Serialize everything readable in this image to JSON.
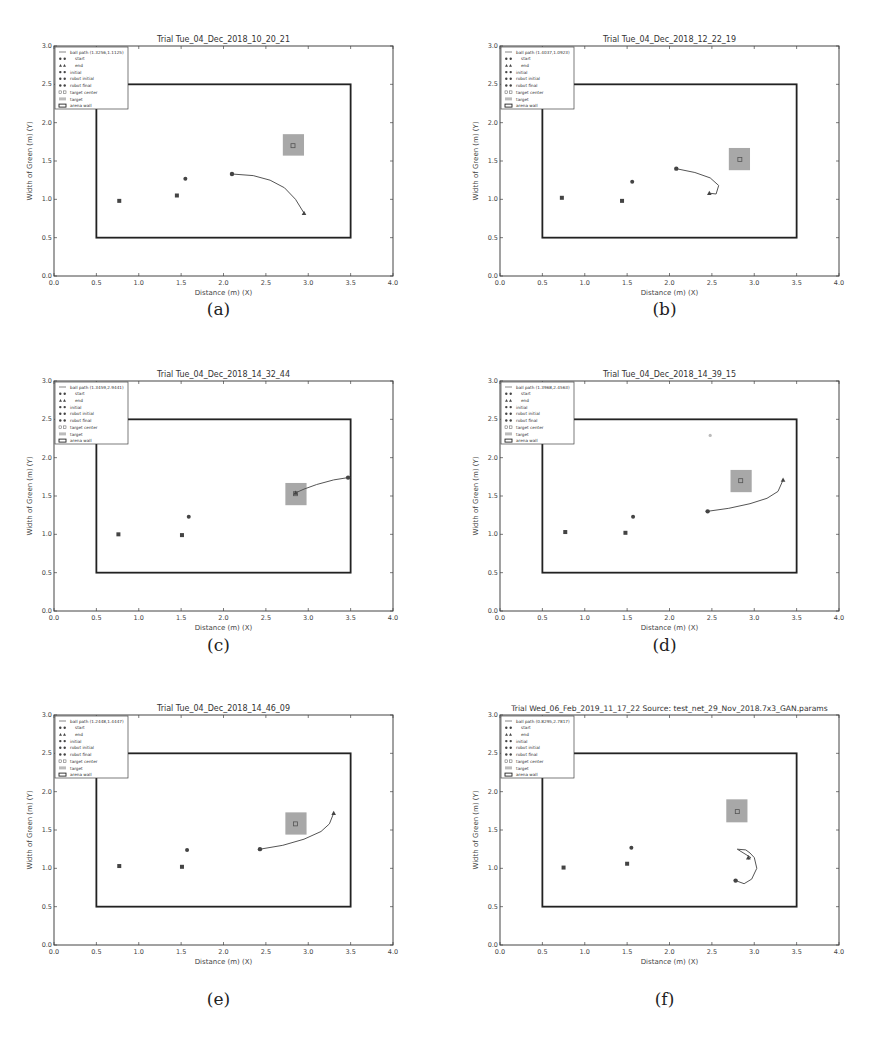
{
  "figure": {
    "panels_count": 6
  },
  "chart_data": [
    {
      "type": "scatter",
      "panel_label": "(a)",
      "title": "Trial Tue_04_Dec_2018_10_20_21",
      "xlabel": "Distance (m) (X)",
      "ylabel": "Width of Green (m) (Y)",
      "xlim": [
        0.0,
        4.0
      ],
      "ylim": [
        0.0,
        3.0
      ],
      "xticks": [
        "0.0",
        "0.5",
        "1.0",
        "1.5",
        "2.0",
        "2.5",
        "3.0",
        "3.5",
        "4.0"
      ],
      "yticks": [
        "0.0",
        "0.5",
        "1.0",
        "1.5",
        "2.0",
        "2.5",
        "3.0"
      ],
      "legend": [
        "ball path (1.3256,1.1125)",
        "start",
        "end",
        "initial",
        "robot initial",
        "robot final",
        "target center",
        "target",
        "arena wall"
      ],
      "arena_wall": {
        "x": [
          0.5,
          3.5
        ],
        "y": [
          0.5,
          2.5
        ]
      },
      "target": {
        "x": [
          2.7,
          2.95
        ],
        "y": [
          1.57,
          1.85
        ]
      },
      "target_center": [
        2.82,
        1.7
      ],
      "robot_initial": [
        0.77,
        0.98
      ],
      "robot_final": [
        1.45,
        1.05
      ],
      "initial": [
        1.55,
        1.27
      ],
      "start": [
        2.1,
        1.33
      ],
      "end": [
        2.95,
        0.82
      ],
      "ball_path": [
        [
          2.1,
          1.33
        ],
        [
          2.35,
          1.31
        ],
        [
          2.55,
          1.25
        ],
        [
          2.72,
          1.15
        ],
        [
          2.85,
          1.0
        ],
        [
          2.95,
          0.82
        ]
      ]
    },
    {
      "type": "scatter",
      "panel_label": "(b)",
      "title": "Trial Tue_04_Dec_2018_12_22_19",
      "xlabel": "Distance (m) (X)",
      "ylabel": "Width of Green (m) (Y)",
      "xlim": [
        0.0,
        4.0
      ],
      "ylim": [
        0.0,
        3.0
      ],
      "xticks": [
        "0.0",
        "0.5",
        "1.0",
        "1.5",
        "2.0",
        "2.5",
        "3.0",
        "3.5",
        "4.0"
      ],
      "yticks": [
        "0.0",
        "0.5",
        "1.0",
        "1.5",
        "2.0",
        "2.5",
        "3.0"
      ],
      "legend": [
        "ball path (1.4037,1.0923)",
        "start",
        "end",
        "initial",
        "robot initial",
        "robot final",
        "target center",
        "target",
        "arena wall"
      ],
      "arena_wall": {
        "x": [
          0.5,
          3.5
        ],
        "y": [
          0.5,
          2.5
        ]
      },
      "target": {
        "x": [
          2.7,
          2.95
        ],
        "y": [
          1.38,
          1.67
        ]
      },
      "target_center": [
        2.83,
        1.52
      ],
      "robot_initial": [
        0.73,
        1.02
      ],
      "robot_final": [
        1.44,
        0.98
      ],
      "initial": [
        1.56,
        1.23
      ],
      "start": [
        2.08,
        1.4
      ],
      "end": [
        2.47,
        1.08
      ],
      "ball_path": [
        [
          2.08,
          1.4
        ],
        [
          2.3,
          1.35
        ],
        [
          2.48,
          1.28
        ],
        [
          2.58,
          1.18
        ],
        [
          2.55,
          1.07
        ],
        [
          2.47,
          1.08
        ]
      ]
    },
    {
      "type": "scatter",
      "panel_label": "(c)",
      "title": "Trial Tue_04_Dec_2018_14_32_44",
      "xlabel": "Distance (m) (X)",
      "ylabel": "Width of Green (m) (Y)",
      "xlim": [
        0.0,
        4.0
      ],
      "ylim": [
        0.0,
        3.0
      ],
      "xticks": [
        "0.0",
        "0.5",
        "1.0",
        "1.5",
        "2.0",
        "2.5",
        "3.0",
        "3.5",
        "4.0"
      ],
      "yticks": [
        "0.0",
        "0.5",
        "1.0",
        "1.5",
        "2.0",
        "2.5",
        "3.0"
      ],
      "legend": [
        "ball path (1.3459,2.9441)",
        "start",
        "end",
        "initial",
        "robot initial",
        "robot final",
        "target center",
        "target",
        "arena wall"
      ],
      "arena_wall": {
        "x": [
          0.5,
          3.5
        ],
        "y": [
          0.5,
          2.5
        ]
      },
      "target": {
        "x": [
          2.73,
          2.98
        ],
        "y": [
          1.38,
          1.67
        ]
      },
      "target_center": [
        2.85,
        1.53
      ],
      "robot_initial": [
        0.76,
        1.0
      ],
      "robot_final": [
        1.51,
        0.99
      ],
      "initial": [
        1.59,
        1.23
      ],
      "start": [
        3.47,
        1.74
      ],
      "end": [
        2.85,
        1.54
      ],
      "ball_path": [
        [
          3.47,
          1.74
        ],
        [
          3.3,
          1.71
        ],
        [
          3.1,
          1.65
        ],
        [
          2.95,
          1.59
        ],
        [
          2.85,
          1.54
        ]
      ]
    },
    {
      "type": "scatter",
      "panel_label": "(d)",
      "title": "Trial Tue_04_Dec_2018_14_39_15",
      "xlabel": "Distance (m) (X)",
      "ylabel": "Width of Green (m) (Y)",
      "xlim": [
        0.0,
        4.0
      ],
      "ylim": [
        0.0,
        3.0
      ],
      "xticks": [
        "0.0",
        "0.5",
        "1.0",
        "1.5",
        "2.0",
        "2.5",
        "3.0",
        "3.5",
        "4.0"
      ],
      "yticks": [
        "0.0",
        "0.5",
        "1.0",
        "1.5",
        "2.0",
        "2.5",
        "3.0"
      ],
      "legend": [
        "ball path (1.3968,2.4563)",
        "start",
        "end",
        "initial",
        "robot initial",
        "robot final",
        "target center",
        "target",
        "arena wall"
      ],
      "arena_wall": {
        "x": [
          0.5,
          3.5
        ],
        "y": [
          0.5,
          2.5
        ]
      },
      "target": {
        "x": [
          2.72,
          2.97
        ],
        "y": [
          1.55,
          1.84
        ]
      },
      "target_center": [
        2.84,
        1.7
      ],
      "robot_initial": [
        0.77,
        1.03
      ],
      "robot_final": [
        1.48,
        1.02
      ],
      "initial": [
        1.57,
        1.23
      ],
      "start": [
        2.45,
        1.3
      ],
      "end": [
        3.34,
        1.71
      ],
      "stray_point": [
        2.48,
        2.29
      ],
      "ball_path": [
        [
          2.45,
          1.3
        ],
        [
          2.7,
          1.34
        ],
        [
          2.95,
          1.4
        ],
        [
          3.15,
          1.47
        ],
        [
          3.28,
          1.56
        ],
        [
          3.34,
          1.71
        ]
      ]
    },
    {
      "type": "scatter",
      "panel_label": "(e)",
      "title": "Trial Tue_04_Dec_2018_14_46_09",
      "xlabel": "Distance (m) (X)",
      "ylabel": "Width of Green (m) (Y)",
      "xlim": [
        0.0,
        4.0
      ],
      "ylim": [
        0.0,
        3.0
      ],
      "xticks": [
        "0.0",
        "0.5",
        "1.0",
        "1.5",
        "2.0",
        "2.5",
        "3.0",
        "3.5",
        "4.0"
      ],
      "yticks": [
        "0.0",
        "0.5",
        "1.0",
        "1.5",
        "2.0",
        "2.5",
        "3.0"
      ],
      "legend": [
        "ball path (1.2448,1.4447)",
        "start",
        "end",
        "initial",
        "robot initial",
        "robot final",
        "target center",
        "target",
        "arena wall"
      ],
      "arena_wall": {
        "x": [
          0.5,
          3.5
        ],
        "y": [
          0.5,
          2.5
        ]
      },
      "target": {
        "x": [
          2.73,
          2.98
        ],
        "y": [
          1.44,
          1.73
        ]
      },
      "target_center": [
        2.85,
        1.58
      ],
      "robot_initial": [
        0.77,
        1.03
      ],
      "robot_final": [
        1.51,
        1.02
      ],
      "initial": [
        1.57,
        1.24
      ],
      "start": [
        2.43,
        1.25
      ],
      "end": [
        3.3,
        1.72
      ],
      "ball_path": [
        [
          2.43,
          1.25
        ],
        [
          2.7,
          1.3
        ],
        [
          2.95,
          1.38
        ],
        [
          3.15,
          1.48
        ],
        [
          3.25,
          1.58
        ],
        [
          3.3,
          1.72
        ]
      ]
    },
    {
      "type": "scatter",
      "panel_label": "(f)",
      "title": "Trial Wed_06_Feb_2019_11_17_22 Source: test_net_29_Nov_2018.7x3_GAN.params",
      "xlabel": "Distance (m) (X)",
      "ylabel": "Width of Green (m) (Y)",
      "xlim": [
        0.0,
        4.0
      ],
      "ylim": [
        0.0,
        3.0
      ],
      "xticks": [
        "0.0",
        "0.5",
        "1.0",
        "1.5",
        "2.0",
        "2.5",
        "3.0",
        "3.5",
        "4.0"
      ],
      "yticks": [
        "0.0",
        "0.5",
        "1.0",
        "1.5",
        "2.0",
        "2.5",
        "3.0"
      ],
      "legend": [
        "ball path (0.8295,2.7817)",
        "start",
        "end",
        "initial",
        "robot initial",
        "robot final",
        "target center",
        "target",
        "arena wall"
      ],
      "arena_wall": {
        "x": [
          0.5,
          3.5
        ],
        "y": [
          0.5,
          2.5
        ]
      },
      "target": {
        "x": [
          2.67,
          2.92
        ],
        "y": [
          1.6,
          1.9
        ]
      },
      "target_center": [
        2.8,
        1.74
      ],
      "robot_initial": [
        0.75,
        1.01
      ],
      "robot_final": [
        1.5,
        1.06
      ],
      "initial": [
        1.55,
        1.27
      ],
      "start": [
        2.78,
        0.84
      ],
      "end": [
        2.93,
        1.14
      ],
      "ball_path": [
        [
          2.78,
          0.84
        ],
        [
          2.88,
          0.8
        ],
        [
          2.97,
          0.86
        ],
        [
          3.03,
          1.0
        ],
        [
          3.0,
          1.14
        ],
        [
          2.95,
          1.2
        ],
        [
          2.9,
          1.24
        ],
        [
          2.8,
          1.25
        ],
        [
          2.96,
          1.14
        ],
        [
          2.93,
          1.12
        ]
      ]
    }
  ]
}
